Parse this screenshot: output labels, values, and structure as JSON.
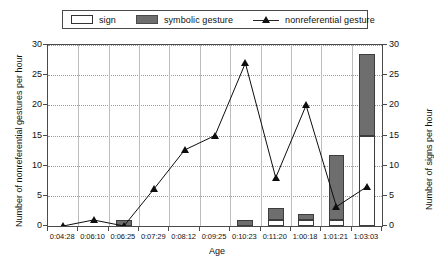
{
  "chart_data": {
    "type": "bar",
    "title": "",
    "xlabel": "Age",
    "ylabel": "Number of nonreferential gestures per hour",
    "y2label": "Number of signs per hour",
    "ylim": [
      0,
      30
    ],
    "y2lim": [
      0,
      30
    ],
    "yticks": [
      0,
      5,
      10,
      15,
      20,
      25,
      30
    ],
    "y2ticks": [
      0,
      5,
      10,
      15,
      20,
      25,
      30
    ],
    "grid": true,
    "legend_position": "top",
    "categories": [
      "0:04:28",
      "0:06:10",
      "0:06:25",
      "0:07:29",
      "0:08:12",
      "0:09:25",
      "0:10:23",
      "0:11:20",
      "1:00:18",
      "1:01:21",
      "1:03:03"
    ],
    "series": [
      {
        "name": "sign",
        "type": "bar",
        "axis": "right",
        "color": "#ffffff",
        "values": [
          0,
          0,
          0,
          0,
          0,
          0,
          0,
          1,
          1,
          1,
          15
        ]
      },
      {
        "name": "symbolic gesture",
        "type": "bar",
        "axis": "right",
        "color": "#6e6e6e",
        "values": [
          0,
          0,
          1,
          0,
          0,
          0,
          1,
          2,
          1,
          10.7,
          13.5
        ]
      },
      {
        "name": "nonreferential gesture",
        "type": "line",
        "axis": "left",
        "color": "#0d0d0d",
        "marker": "triangle",
        "values": [
          0,
          1,
          0,
          6.2,
          12.6,
          15,
          27,
          8,
          20,
          3.2,
          6.5
        ]
      }
    ]
  },
  "legend": {
    "items": [
      {
        "label": "sign",
        "swatch": "white-box-swatch"
      },
      {
        "label": "symbolic gesture",
        "swatch": "gray-box-swatch"
      },
      {
        "label": "nonreferential gesture",
        "swatch": "line-triangle-marker"
      }
    ]
  },
  "axes": {
    "x_title": "Age",
    "y_left_title": "Number of nonreferential gestures per hour",
    "y_right_title": "Number of signs per hour"
  }
}
